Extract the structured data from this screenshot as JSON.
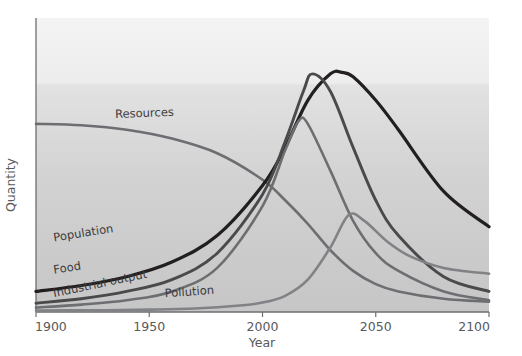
{
  "chart_data": {
    "type": "line",
    "title": "",
    "subtitle": "",
    "xlabel": "Year",
    "ylabel": "Quantity",
    "xlim": [
      1900,
      2100
    ],
    "ylim": [
      0,
      100
    ],
    "grid": false,
    "legend_position": "inline-curve-labels",
    "xticks": [
      "1900",
      "1950",
      "2000",
      "2050",
      "2100"
    ],
    "xtick_values": [
      1900,
      1950,
      2000,
      2050,
      2100
    ],
    "yticks": [],
    "series": [
      {
        "name": "Resources",
        "color": "#6d6e71",
        "width": 2.6,
        "label_x": 1935,
        "label_y": 66,
        "x": [
          1900,
          1920,
          1940,
          1960,
          1980,
          2000,
          2010,
          2020,
          2030,
          2040,
          2050,
          2060,
          2080,
          2100
        ],
        "values": [
          64,
          63.5,
          62,
          59,
          54,
          45,
          38,
          30,
          21,
          14,
          9.5,
          7,
          4.5,
          3.5
        ]
      },
      {
        "name": "Population",
        "color": "#231f20",
        "width": 3.2,
        "label_x": 1908,
        "label_y": 24,
        "x": [
          1900,
          1920,
          1940,
          1960,
          1980,
          2000,
          2010,
          2020,
          2030,
          2035,
          2040,
          2050,
          2060,
          2080,
          2100
        ],
        "values": [
          7,
          9,
          12,
          17,
          26,
          43,
          56,
          72,
          81,
          81.5,
          80,
          72,
          62,
          41,
          29
        ]
      },
      {
        "name": "Food",
        "color": "#4a4a4c",
        "width": 2.9,
        "label_x": 1908,
        "label_y": 13,
        "x": [
          1900,
          1920,
          1940,
          1960,
          1980,
          2000,
          2010,
          2018,
          2022,
          2030,
          2040,
          2050,
          2060,
          2080,
          2100
        ],
        "values": [
          3,
          4.5,
          7,
          11,
          20,
          40,
          58,
          75,
          81,
          75,
          56,
          38,
          26,
          12,
          7
        ]
      },
      {
        "name": "Industrial output",
        "color": "#6d6e71",
        "width": 2.6,
        "label_x": 1908,
        "label_y": 5,
        "x": [
          1900,
          1920,
          1940,
          1960,
          1980,
          2000,
          2010,
          2016,
          2020,
          2030,
          2040,
          2050,
          2060,
          2080,
          2100
        ],
        "values": [
          1.5,
          2.5,
          4,
          7,
          15,
          36,
          55,
          65,
          64,
          48,
          31,
          20,
          14,
          7,
          4
        ]
      },
      {
        "name": "Pollution",
        "color": "#808285",
        "width": 2.6,
        "label_x": 1957,
        "label_y": 5,
        "x": [
          1900,
          1930,
          1950,
          1970,
          1990,
          2000,
          2010,
          2020,
          2030,
          2038,
          2045,
          2055,
          2065,
          2080,
          2100
        ],
        "values": [
          0.5,
          0.6,
          0.8,
          1.2,
          2.2,
          3.2,
          5.5,
          11,
          22,
          33,
          31,
          24,
          19,
          15,
          13
        ]
      }
    ]
  },
  "axes": {
    "x_title": "Year",
    "y_title": "Quantity"
  },
  "style": {
    "plot_bg_top": "#f1f1f1",
    "plot_bg_bottom": "#c9c9c9",
    "axis_color": "#6d6e71",
    "tick_text_color": "#58595b"
  }
}
